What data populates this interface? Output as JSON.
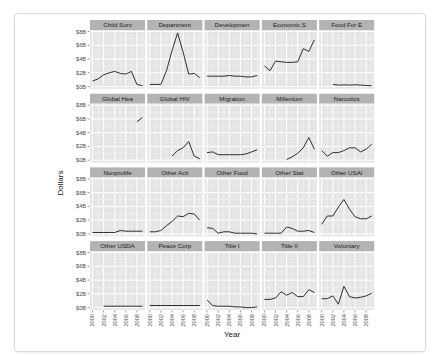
{
  "chart_data": {
    "type": "line",
    "layout": "facet_wrap",
    "ncol": 5,
    "nrow": 4,
    "xlabel": "Year",
    "ylabel": "Dollars",
    "x_ticks": [
      "2000",
      "2002",
      "2004",
      "2006",
      "2008"
    ],
    "y_ticks": [
      "$0B",
      "$2B",
      "$4B",
      "$6B",
      "$8B"
    ],
    "ylim": [
      0,
      8
    ],
    "xlim": [
      2000,
      2009
    ],
    "grid": true,
    "legend": "none",
    "panel_background": "#e5e5e5",
    "strip_background": "#b3b3b3",
    "line_color": "#1a1a1a",
    "facets": [
      {
        "title": "Child Surv",
        "x": [
          2000,
          2001,
          2002,
          2003,
          2004,
          2005,
          2006,
          2007,
          2008,
          2009
        ],
        "values": [
          0.8,
          1.1,
          1.7,
          2.0,
          2.2,
          1.9,
          1.8,
          2.2,
          0.3,
          0.1
        ]
      },
      {
        "title": "Department",
        "x": [
          2000,
          2001,
          2002,
          2003,
          2004,
          2005,
          2006,
          2007,
          2008,
          2009
        ],
        "values": [
          0.3,
          0.3,
          0.3,
          2.3,
          5.2,
          7.8,
          5.0,
          1.8,
          1.9,
          1.3
        ]
      },
      {
        "title": "Developmen",
        "x": [
          2000,
          2001,
          2002,
          2003,
          2004,
          2005,
          2006,
          2007,
          2008,
          2009
        ],
        "values": [
          1.5,
          1.5,
          1.5,
          1.5,
          1.6,
          1.5,
          1.5,
          1.4,
          1.4,
          1.6
        ]
      },
      {
        "title": "Economic S",
        "x": [
          2000,
          2001,
          2002,
          2003,
          2004,
          2005,
          2006,
          2007,
          2008,
          2009
        ],
        "values": [
          3.0,
          2.3,
          3.7,
          3.6,
          3.5,
          3.5,
          3.6,
          5.5,
          5.1,
          6.8
        ]
      },
      {
        "title": "Food For E",
        "x": [
          2002,
          2003,
          2004,
          2005,
          2006,
          2007,
          2008,
          2009
        ],
        "values": [
          0.3,
          0.2,
          0.25,
          0.2,
          0.25,
          0.2,
          0.15,
          0.1
        ]
      },
      {
        "title": "Global Hea",
        "x": [
          2008,
          2009
        ],
        "values": [
          5.6,
          6.2
        ]
      },
      {
        "title": "Global HIV",
        "x": [
          2004,
          2005,
          2006,
          2007,
          2008,
          2009
        ],
        "values": [
          0.6,
          1.4,
          1.8,
          2.7,
          0.6,
          0.2
        ]
      },
      {
        "title": "Migration",
        "x": [
          2000,
          2001,
          2002,
          2003,
          2004,
          2005,
          2006,
          2007,
          2008,
          2009
        ],
        "values": [
          1.1,
          1.2,
          0.8,
          0.8,
          0.8,
          0.8,
          0.8,
          0.9,
          1.2,
          1.5
        ]
      },
      {
        "title": "Millenium",
        "x": [
          2004,
          2005,
          2006,
          2007,
          2008,
          2009
        ],
        "values": [
          0.1,
          0.5,
          1.0,
          1.8,
          3.3,
          1.6
        ]
      },
      {
        "title": "Narcotics",
        "x": [
          2000,
          2001,
          2002,
          2003,
          2004,
          2005,
          2006,
          2007,
          2008,
          2009
        ],
        "values": [
          1.4,
          0.6,
          1.1,
          1.1,
          1.4,
          1.8,
          1.8,
          1.2,
          1.6,
          2.3
        ]
      },
      {
        "title": "Nonprolife",
        "x": [
          2000,
          2001,
          2002,
          2003,
          2004,
          2005,
          2006,
          2007,
          2008,
          2009
        ],
        "values": [
          0.2,
          0.2,
          0.2,
          0.2,
          0.2,
          0.5,
          0.4,
          0.4,
          0.4,
          0.4
        ]
      },
      {
        "title": "Other Acti",
        "x": [
          2000,
          2001,
          2002,
          2003,
          2004,
          2005,
          2006,
          2007,
          2008,
          2009
        ],
        "values": [
          0.3,
          0.3,
          0.5,
          1.2,
          1.8,
          2.6,
          2.5,
          3.0,
          2.9,
          2.0
        ]
      },
      {
        "title": "Other Food",
        "x": [
          2000,
          2001,
          2002,
          2003,
          2004,
          2005,
          2006,
          2007,
          2008,
          2009
        ],
        "values": [
          0.9,
          0.8,
          0.1,
          0.3,
          0.3,
          0.1,
          0.1,
          0.1,
          0.1,
          0.0
        ]
      },
      {
        "title": "Other Stat",
        "x": [
          2000,
          2001,
          2002,
          2003,
          2004,
          2005,
          2006,
          2007,
          2008,
          2009
        ],
        "values": [
          0.1,
          0.1,
          0.1,
          0.1,
          1.0,
          0.8,
          0.4,
          0.4,
          0.5,
          0.2
        ]
      },
      {
        "title": "Other USAI",
        "x": [
          2000,
          2001,
          2002,
          2003,
          2004,
          2005,
          2006,
          2007,
          2008,
          2009
        ],
        "values": [
          1.4,
          2.6,
          2.6,
          3.9,
          5.0,
          3.6,
          2.5,
          2.2,
          2.2,
          2.6
        ]
      },
      {
        "title": "Other USDA",
        "x": [
          2002,
          2003,
          2004,
          2005,
          2006,
          2007,
          2008,
          2009
        ],
        "values": [
          0.2,
          0.2,
          0.2,
          0.2,
          0.2,
          0.2,
          0.2,
          0.2
        ]
      },
      {
        "title": "Peace Corp",
        "x": [
          2000,
          2001,
          2002,
          2003,
          2004,
          2005,
          2006,
          2007,
          2008,
          2009
        ],
        "values": [
          0.3,
          0.3,
          0.3,
          0.3,
          0.3,
          0.3,
          0.3,
          0.3,
          0.3,
          0.3
        ]
      },
      {
        "title": "Title I",
        "x": [
          2000,
          2001,
          2002,
          2003,
          2004,
          2005,
          2006,
          2007,
          2008,
          2009
        ],
        "values": [
          1.1,
          0.3,
          0.2,
          0.2,
          0.2,
          0.1,
          0.1,
          0.0,
          0.0,
          0.1
        ]
      },
      {
        "title": "Title II",
        "x": [
          2000,
          2001,
          2002,
          2003,
          2004,
          2005,
          2006,
          2007,
          2008,
          2009
        ],
        "values": [
          1.2,
          1.2,
          1.4,
          2.3,
          1.8,
          2.2,
          1.6,
          1.6,
          2.6,
          2.2
        ]
      },
      {
        "title": "Voluntary",
        "x": [
          2000,
          2001,
          2002,
          2003,
          2004,
          2005,
          2006,
          2007,
          2008,
          2009
        ],
        "values": [
          1.3,
          1.3,
          1.7,
          0.5,
          3.1,
          1.6,
          1.4,
          1.5,
          1.7,
          2.1
        ]
      }
    ]
  }
}
